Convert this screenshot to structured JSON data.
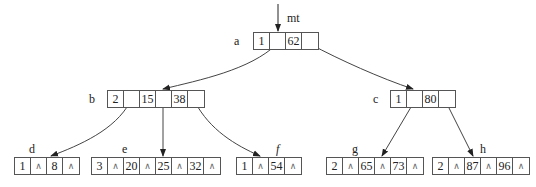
{
  "root_pointer_label": "mt",
  "null_symbol": "∧",
  "nodes": {
    "a": {
      "label": "a",
      "n": "1",
      "k1": "",
      "k2": "62",
      "k3": ""
    },
    "b": {
      "label": "b",
      "n": "2",
      "k1": "",
      "k2": "15",
      "k3": "",
      "k4": "38",
      "k5": ""
    },
    "c": {
      "label": "c",
      "n": "1",
      "k1": "",
      "k2": "80",
      "k3": ""
    },
    "d": {
      "label": "d",
      "n": "1",
      "k1": "∧",
      "k2": "8",
      "k3": "∧"
    },
    "e": {
      "label": "e",
      "n": "3",
      "k1": "∧",
      "k2": "20",
      "k3": "∧",
      "k4": "25",
      "k5": "∧",
      "k6": "32",
      "k7": "∧"
    },
    "f": {
      "label": "f",
      "n": "1",
      "k1": "∧",
      "k2": "54",
      "k3": "∧"
    },
    "g": {
      "label": "g",
      "n": "2",
      "k1": "∧",
      "k2": "65",
      "k3": "∧",
      "k4": "73",
      "k5": "∧"
    },
    "h": {
      "label": "h",
      "n": "2",
      "k1": "∧",
      "k2": "87",
      "k3": "∧",
      "k4": "96",
      "k5": "∧"
    }
  }
}
